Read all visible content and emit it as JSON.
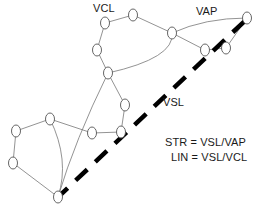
{
  "diagram": {
    "labels": [
      {
        "id": "vcl",
        "text": "VCL",
        "x": 93,
        "y": 2
      },
      {
        "id": "vap",
        "text": "VAP",
        "x": 196,
        "y": 5
      },
      {
        "id": "vsl",
        "text": "VSL",
        "x": 163,
        "y": 96
      }
    ],
    "legend": [
      {
        "id": "str",
        "text": "STR = VSL/VAP"
      },
      {
        "id": "lin",
        "text": "LIN = VSL/VCL"
      }
    ],
    "colors": {
      "node_stroke": "#555555",
      "node_fill": "#ffffff",
      "edge": "#777777",
      "boundary": "#000000",
      "text": "#1a1a1a",
      "background": "#ffffff"
    },
    "style": {
      "node_rx": 4.5,
      "node_ry": 6.0,
      "node_stroke_width": 0.9,
      "edge_stroke_width": 0.8,
      "boundary_stroke_width": 4.5,
      "boundary_dash": "16 11"
    },
    "nodes": [
      {
        "id": "n1",
        "x": 105,
        "y": 23
      },
      {
        "id": "n2",
        "x": 133,
        "y": 15
      },
      {
        "id": "n3",
        "x": 97,
        "y": 50
      },
      {
        "id": "n4",
        "x": 108,
        "y": 73
      },
      {
        "id": "n5",
        "x": 172,
        "y": 33
      },
      {
        "id": "n6",
        "x": 247,
        "y": 18
      },
      {
        "id": "n7",
        "x": 205,
        "y": 50
      },
      {
        "id": "n8",
        "x": 226,
        "y": 48
      },
      {
        "id": "n9",
        "x": 125,
        "y": 105
      },
      {
        "id": "n10",
        "x": 121,
        "y": 132
      },
      {
        "id": "n11",
        "x": 92,
        "y": 133
      },
      {
        "id": "n12",
        "x": 50,
        "y": 119
      },
      {
        "id": "n13",
        "x": 16,
        "y": 131
      },
      {
        "id": "n14",
        "x": 13,
        "y": 163
      },
      {
        "id": "n15",
        "x": 58,
        "y": 197
      }
    ],
    "edges": [
      {
        "from": "n1",
        "to": "n2"
      },
      {
        "from": "n1",
        "to": "n3"
      },
      {
        "from": "n2",
        "to": "n5"
      },
      {
        "from": "n3",
        "to": "n4"
      },
      {
        "from": "n4",
        "to": "n5",
        "curve": true,
        "cx": 175,
        "cy": 58
      },
      {
        "from": "n4",
        "to": "n9"
      },
      {
        "from": "n4",
        "to": "n15",
        "curve": true,
        "cx": 75,
        "cy": 140
      },
      {
        "from": "n5",
        "to": "n6",
        "curve": true,
        "cx": 205,
        "cy": 18
      },
      {
        "from": "n5",
        "to": "n7"
      },
      {
        "from": "n6",
        "to": "n8"
      },
      {
        "from": "n7",
        "to": "n8"
      },
      {
        "from": "n9",
        "to": "n10"
      },
      {
        "from": "n10",
        "to": "n11"
      },
      {
        "from": "n11",
        "to": "n12"
      },
      {
        "from": "n12",
        "to": "n13"
      },
      {
        "from": "n12",
        "to": "n15",
        "curve": true,
        "cx": 70,
        "cy": 160
      },
      {
        "from": "n13",
        "to": "n14"
      },
      {
        "from": "n14",
        "to": "n15"
      }
    ],
    "boundary": {
      "id": "vsl-boundary",
      "x1": 56,
      "y1": 199,
      "x2": 250,
      "y2": 16
    }
  }
}
